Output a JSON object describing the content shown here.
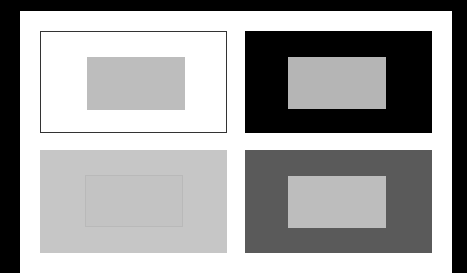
{
  "figure": {
    "background_color": "#000000",
    "sheet_color": "#ffffff",
    "panels": [
      {
        "id": "p1",
        "background": "#ffffff",
        "border": "#333333",
        "inner_color": "#bdbdbd"
      },
      {
        "id": "p2",
        "background": "#000000",
        "border": "none",
        "inner_color": "#b5b5b5"
      },
      {
        "id": "p3",
        "background": "#c6c6c6",
        "border": "none",
        "inner_color": "#c3c3c3"
      },
      {
        "id": "p4",
        "background": "#5a5a5a",
        "border": "none",
        "inner_color": "#bdbdbd"
      }
    ]
  }
}
